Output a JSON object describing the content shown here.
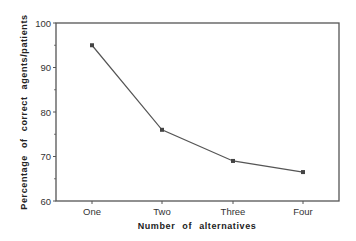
{
  "chart_data": {
    "type": "line",
    "title": "",
    "xlabel": "Number of alternatives",
    "ylabel": "Percentage of correct agents/patients",
    "categories": [
      "One",
      "Two",
      "Three",
      "Four"
    ],
    "values": [
      95,
      76,
      69,
      66.5
    ],
    "series": [
      {
        "name": "Percentage correct",
        "values": [
          95,
          76,
          69,
          66.5
        ],
        "marker": "square"
      }
    ],
    "ylim": [
      60,
      100
    ],
    "yticks": [
      60,
      70,
      80,
      90,
      100
    ],
    "yminor_ticks": [
      65,
      75,
      85,
      95
    ],
    "grid": false,
    "legend": null
  },
  "style": {
    "line_color": "#555555",
    "axis_color": "#555555",
    "marker_color": "#444444"
  }
}
